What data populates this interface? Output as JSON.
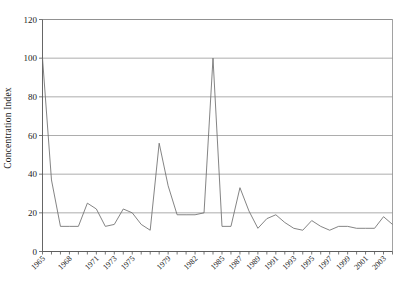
{
  "chart_data": {
    "type": "line",
    "title": "",
    "xlabel": "",
    "ylabel": "Concentration Index",
    "ylim": [
      0,
      120
    ],
    "xlim": [
      1965,
      2004
    ],
    "grid": true,
    "legend": null,
    "y_ticks": [
      0,
      20,
      40,
      60,
      80,
      100,
      120
    ],
    "y_tick_labels": [
      "0",
      "20",
      "40",
      "60",
      "80",
      "100",
      "120"
    ],
    "x_tick_labels": [
      "1965",
      "1968",
      "1971",
      "1973",
      "1975",
      "1979",
      "1982",
      "1985",
      "1987",
      "1989",
      "1991",
      "1993",
      "1995",
      "1997",
      "1999",
      "2001",
      "2003"
    ],
    "series": [
      {
        "name": "Concentration Index",
        "x": [
          1965,
          1966,
          1967,
          1968,
          1969,
          1970,
          1971,
          1972,
          1973,
          1974,
          1975,
          1976,
          1977,
          1978,
          1979,
          1980,
          1981,
          1982,
          1983,
          1984,
          1985,
          1986,
          1987,
          1988,
          1989,
          1990,
          1991,
          1992,
          1993,
          1994,
          1995,
          1996,
          1997,
          1998,
          1999,
          2000,
          2001,
          2002,
          2003,
          2004
        ],
        "values": [
          100,
          37,
          13,
          13,
          13,
          25,
          22,
          13,
          14,
          22,
          20,
          14,
          11,
          56,
          34,
          19,
          19,
          19,
          20,
          100,
          13,
          13,
          33,
          21,
          12,
          17,
          19,
          15,
          12,
          11,
          16,
          13,
          11,
          13,
          13,
          12,
          12,
          12,
          18,
          14
        ]
      }
    ]
  },
  "axes": {
    "y_axis_title": "Concentration Index"
  }
}
